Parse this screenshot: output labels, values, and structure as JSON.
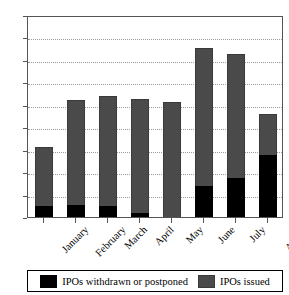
{
  "chart_data": {
    "type": "bar",
    "stacked": true,
    "title": "",
    "xlabel": "",
    "ylabel": "",
    "ylim": [
      0,
      90
    ],
    "ytick_step": 10,
    "yticks": [
      0,
      10,
      20,
      30,
      40,
      50,
      60,
      70,
      80,
      90
    ],
    "grid": true,
    "grid_style": "dotted-horizontal",
    "legend_position": "bottom",
    "categories": [
      "January",
      "February",
      "March",
      "April",
      "May",
      "June",
      "July",
      "August"
    ],
    "series": [
      {
        "name": "IPOs withdrawn or postponed",
        "color": "#000000",
        "values": [
          5,
          5.3,
          4.7,
          1.8,
          0,
          14,
          17.5,
          27.5
        ]
      },
      {
        "name": "IPOs issued",
        "color": "#4a4a4a",
        "values": [
          26.3,
          47,
          49.3,
          50.7,
          51.3,
          61.5,
          55,
          18.5
        ]
      }
    ],
    "totals": [
      31.3,
      52.3,
      54,
      52.5,
      51.3,
      75.5,
      72.5,
      46
    ]
  },
  "axes": {
    "y_tick_labels": [
      "90",
      "80",
      "70",
      "60",
      "50",
      "40",
      "30",
      "20",
      "10",
      "0"
    ],
    "x_tick_labels": [
      "January",
      "February",
      "March",
      "April",
      "May",
      "June",
      "July",
      "August"
    ]
  },
  "legend": {
    "entries": [
      {
        "label": "IPOs withdrawn or postponed",
        "swatch": "black"
      },
      {
        "label": "IPOs issued",
        "swatch": "gray"
      }
    ]
  },
  "colors": {
    "withdrawn": "#000000",
    "issued": "#4a4a4a",
    "frame": "#555555",
    "grid": "#9a9a9a",
    "background": "#ffffff"
  }
}
